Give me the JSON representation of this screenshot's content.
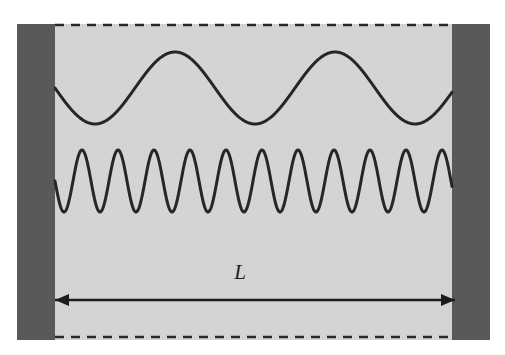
{
  "figure": {
    "title_semantic": "particle-in-a-box-standing-waves",
    "background_color": "#ffffff",
    "width": 505,
    "height": 355
  },
  "box": {
    "name": "potential-well-box",
    "fill_color": "#d4d4d4",
    "x": 17,
    "y": 24,
    "width": 473,
    "height": 316
  },
  "walls": {
    "fill_color": "#595959",
    "left": {
      "name": "left-wall",
      "x": 17,
      "y": 24,
      "width": 38,
      "height": 316
    },
    "right": {
      "name": "right-wall",
      "x": 452,
      "y": 24,
      "width": 38,
      "height": 316
    }
  },
  "boundaries": {
    "stroke_color": "#2b2b2b",
    "dash_pattern": "9 7",
    "stroke_width": 2.6,
    "top": {
      "name": "top-dashed-boundary",
      "x1": 55,
      "y1": 25,
      "x2": 452,
      "y2": 25
    },
    "bottom": {
      "name": "bottom-dashed-boundary",
      "x1": 55,
      "y1": 337,
      "x2": 452,
      "y2": 337
    }
  },
  "waves": {
    "stroke_color": "#262626",
    "stroke_width": 3.0,
    "upper": {
      "name": "upper-standing-wave",
      "label": "long wavelength mode",
      "x_start": 55,
      "x_end": 452,
      "midline_y": 88,
      "amplitude": 36,
      "wavelength": 160,
      "cycles": 2.48,
      "phase": "starts at midline descending"
    },
    "lower": {
      "name": "lower-standing-wave",
      "label": "short wavelength mode",
      "x_start": 55,
      "x_end": 452,
      "midline_y": 181,
      "amplitude": 31,
      "wavelength": 36,
      "cycles": 11.0,
      "phase": "starts at midline descending"
    }
  },
  "dimension": {
    "name": "box-length-dimension",
    "label": "L",
    "label_x": 240,
    "label_y": 279,
    "arrow": {
      "name": "length-arrow",
      "y": 300,
      "x1": 55,
      "x2": 455,
      "stroke_color": "#1c1c1c",
      "stroke_width": 2.6,
      "head_length": 14,
      "head_half_width": 6,
      "double_headed": true
    }
  },
  "chart_data": {
    "type": "line",
    "title": "",
    "xlabel": "L",
    "ylabel": "",
    "grid": false,
    "legend": "none",
    "xlim": [
      55,
      452
    ],
    "series": [
      {
        "name": "upper-standing-wave",
        "form": "sine",
        "midline_y": 88,
        "amplitude": 36,
        "wavelength": 160,
        "cycles": 2.48,
        "peaks_x": [
          170,
          330
        ],
        "troughs_x": [
          95,
          250,
          410
        ],
        "y_peak": 52,
        "y_trough": 124,
        "endpoints_y": [
          82,
          82
        ]
      },
      {
        "name": "lower-standing-wave",
        "form": "sine",
        "midline_y": 181,
        "amplitude": 31,
        "wavelength": 36,
        "cycles": 11.0,
        "y_peak": 150,
        "y_trough": 212,
        "endpoints_y": [
          176,
          185
        ]
      }
    ]
  }
}
